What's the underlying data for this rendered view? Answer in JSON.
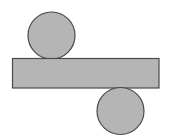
{
  "diagram": {
    "colors": {
      "background": "#ffffff",
      "fill": "#b5b5b5",
      "stroke": "#4a4a4a"
    },
    "shapes": {
      "top_circle": {
        "cx": 51.5,
        "cy": 35.5,
        "r": 23.5
      },
      "rectangle": {
        "x": 12.5,
        "y": 58.5,
        "width": 146.5,
        "height": 29.5
      },
      "bottom_circle": {
        "cx": 120.5,
        "cy": 111,
        "r": 23.5
      }
    }
  }
}
